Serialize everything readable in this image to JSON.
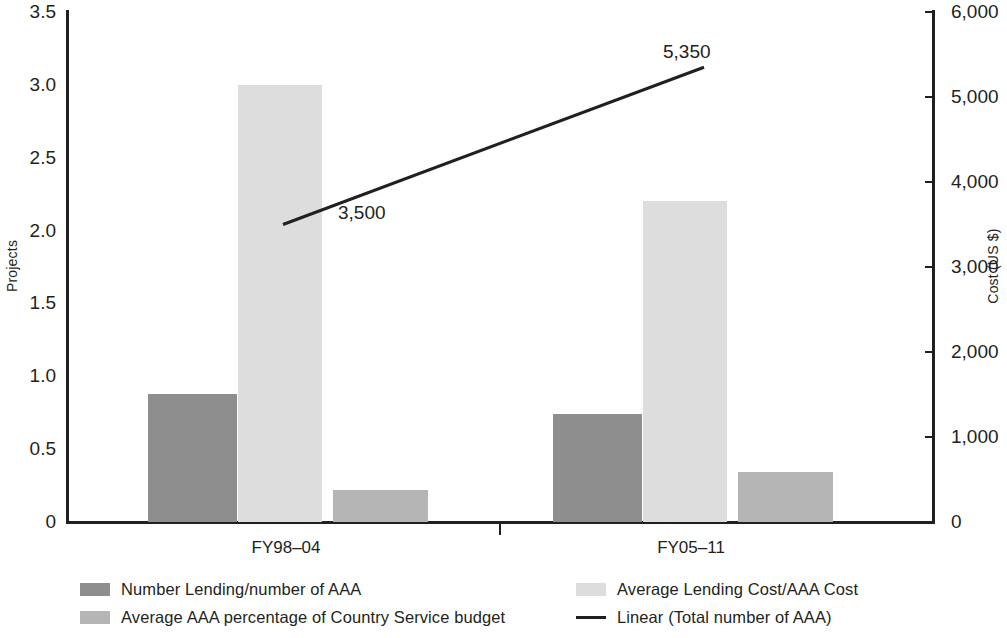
{
  "chart_data": {
    "type": "bar",
    "title": "",
    "subtitle": "",
    "categories": [
      "FY98–04",
      "FY05–11"
    ],
    "series": [
      {
        "name": "Number Lending/number of AAA",
        "color": "#8e8e8e",
        "axis": "left",
        "values": [
          0.88,
          0.74
        ]
      },
      {
        "name": "Average Lending Cost/AAA Cost",
        "color": "#dddddd",
        "axis": "left",
        "values": [
          3.0,
          2.2
        ]
      },
      {
        "name": "Average AAA percentage of Country Service budget",
        "color": "#b5b5b5",
        "axis": "left",
        "values": [
          0.22,
          0.34
        ]
      }
    ],
    "trendline": {
      "name": "Linear (Total number of AAA)",
      "color": "#231f20",
      "axis": "right",
      "points": [
        {
          "category": "FY98–04",
          "value": 3500,
          "label": "3,500"
        },
        {
          "category": "FY05–11",
          "value": 5350,
          "label": "5,350"
        }
      ]
    },
    "xlabel": "",
    "ylabel": "Projects",
    "y2label": "Cost (US $)",
    "ylim": [
      0,
      3.5
    ],
    "y2lim": [
      0,
      6000
    ],
    "yticks": [
      "0",
      "0.5",
      "1.0",
      "1.5",
      "2.0",
      "2.5",
      "3.0",
      "3.5"
    ],
    "ytick_values": [
      0,
      0.5,
      1.0,
      1.5,
      2.0,
      2.5,
      3.0,
      3.5
    ],
    "y2ticks": [
      "0",
      "1,000",
      "2,000",
      "3,000",
      "4,000",
      "5,000",
      "6,000"
    ],
    "y2tick_values": [
      0,
      1000,
      2000,
      3000,
      4000,
      5000,
      6000
    ],
    "grid": false,
    "legend_position": "bottom"
  },
  "axes": {
    "left_title": "Projects",
    "right_title": "Cost (US $)"
  },
  "legend": {
    "items": [
      {
        "label": "Number Lending/number of AAA",
        "swatch": "#8e8e8e",
        "kind": "swatch"
      },
      {
        "label": "Average AAA percentage of Country Service budget",
        "swatch": "#b5b5b5",
        "kind": "swatch"
      },
      {
        "label": "Average Lending Cost/AAA Cost",
        "swatch": "#dddddd",
        "kind": "swatch"
      },
      {
        "label": "Linear (Total number of AAA)",
        "swatch": "#231f20",
        "kind": "line"
      }
    ]
  }
}
